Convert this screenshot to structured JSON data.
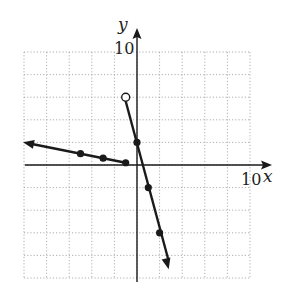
{
  "chart_data": {
    "type": "line",
    "title": "",
    "xlabel": "x",
    "ylabel": "y",
    "x_tick_label": "10",
    "y_tick_label": "10",
    "xlim": [
      -10,
      10
    ],
    "ylim": [
      -10,
      10
    ],
    "grid": true,
    "grid_step": 2,
    "series": [
      {
        "name": "left-piece",
        "equation": "y = -0.2x, x <= -1",
        "arrow": "left",
        "points": [
          [
            -5,
            1
          ],
          [
            -3,
            0.6
          ],
          [
            -1,
            0.2
          ]
        ],
        "closed_points": [
          [
            -5,
            1
          ],
          [
            -3,
            0.6
          ],
          [
            -1,
            0.2
          ]
        ]
      },
      {
        "name": "right-piece",
        "equation": "y = -4x + 2, x > -1",
        "arrow": "down",
        "open_point": [
          -1,
          6
        ],
        "closed_points": [
          [
            0,
            2
          ],
          [
            1,
            -2
          ],
          [
            2,
            -6
          ]
        ]
      }
    ]
  },
  "labels": {
    "x_axis": "x",
    "y_axis": "y",
    "x_max": "10",
    "y_max": "10"
  },
  "colors": {
    "line": "#1a1a1a",
    "grid": "#9a9a9a",
    "background": "#ffffff"
  }
}
